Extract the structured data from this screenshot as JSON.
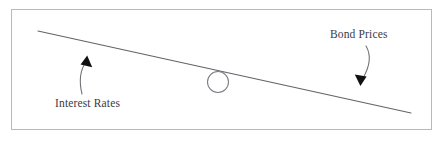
{
  "figure": {
    "type": "diagram",
    "background_color": "#ffffff",
    "border_color": "#b9b9bd",
    "ink_color": "#5a5a5f",
    "arrow_fill_color": "#111111",
    "text_color": "#3b3b3f"
  },
  "labels": {
    "left": "Interest Rates",
    "right": "Bond Prices"
  },
  "icons": {
    "fulcrum": "circle-icon",
    "beam": "tilted-beam-icon",
    "left_arrow": "curved-arrow-up-icon",
    "right_arrow": "curved-arrow-down-icon"
  },
  "geometry": {
    "beam": {
      "x1": 38,
      "y1": 31,
      "x2": 411,
      "y2": 113
    },
    "fulcrum": {
      "cx": 218,
      "cy": 82,
      "r": 10.5
    },
    "left_arc": {
      "start_x": 82,
      "start_y": 93,
      "end_x": 88,
      "end_y": 60
    },
    "right_arc": {
      "start_x": 366,
      "start_y": 47,
      "end_x": 362,
      "end_y": 82
    }
  }
}
